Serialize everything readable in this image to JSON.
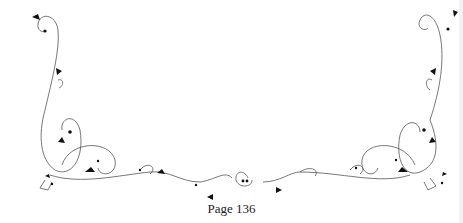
{
  "page": {
    "footer": {
      "page_number_text": "Page 136"
    },
    "ornament": {
      "icon": "floral-scroll-border-icon",
      "line_color": "#555555",
      "leaf_color": "#111111"
    }
  }
}
